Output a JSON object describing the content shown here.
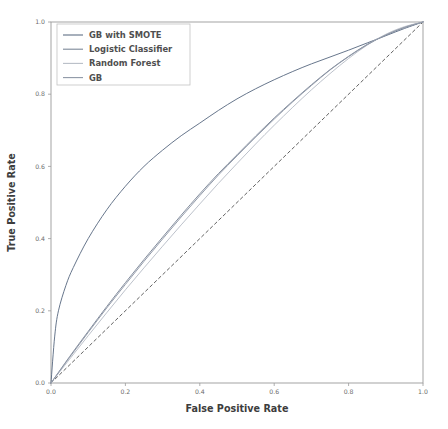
{
  "chart_data": {
    "type": "line",
    "title": "",
    "xlabel": "False Positive Rate",
    "ylabel": "True Positive Rate",
    "xlim": [
      0.0,
      1.0
    ],
    "ylim": [
      0.0,
      1.0
    ],
    "grid": false,
    "legend_position": "upper-left",
    "xticks": [
      "0.0",
      "0.2",
      "0.4",
      "0.6",
      "0.8",
      "1.0"
    ],
    "xtick_values": [
      0.0,
      0.2,
      0.4,
      0.6,
      0.8,
      1.0
    ],
    "yticks": [
      "0.0",
      "0.2",
      "0.4",
      "0.6",
      "0.8",
      "1.0"
    ],
    "ytick_values": [
      0.0,
      0.2,
      0.4,
      0.6,
      0.8,
      1.0
    ],
    "series": [
      {
        "name": "GB with SMOTE",
        "color": "#5f6f86",
        "dash": "none",
        "x": [
          0.0,
          0.01,
          0.02,
          0.04,
          0.06,
          0.1,
          0.15,
          0.2,
          0.25,
          0.3,
          0.35,
          0.4,
          0.45,
          0.5,
          0.55,
          0.6,
          0.65,
          0.7,
          0.75,
          0.8,
          0.85,
          0.9,
          0.95,
          1.0
        ],
        "values": [
          0.0,
          0.13,
          0.2,
          0.27,
          0.32,
          0.4,
          0.48,
          0.545,
          0.6,
          0.645,
          0.685,
          0.72,
          0.755,
          0.787,
          0.815,
          0.84,
          0.863,
          0.884,
          0.903,
          0.922,
          0.942,
          0.962,
          0.982,
          1.0
        ]
      },
      {
        "name": "Logistic Classifier",
        "color": "#7d8899",
        "dash": "none",
        "x": [
          0.0,
          0.05,
          0.1,
          0.15,
          0.2,
          0.25,
          0.3,
          0.35,
          0.4,
          0.45,
          0.5,
          0.55,
          0.6,
          0.65,
          0.7,
          0.75,
          0.8,
          0.85,
          0.9,
          0.95,
          1.0
        ],
        "values": [
          0.0,
          0.073,
          0.143,
          0.212,
          0.278,
          0.342,
          0.404,
          0.465,
          0.524,
          0.58,
          0.632,
          0.684,
          0.734,
          0.781,
          0.826,
          0.868,
          0.905,
          0.938,
          0.964,
          0.985,
          1.0
        ]
      },
      {
        "name": "Random Forest",
        "color": "#b8bec7",
        "dash": "none",
        "x": [
          0.0,
          0.05,
          0.1,
          0.15,
          0.2,
          0.25,
          0.3,
          0.35,
          0.4,
          0.45,
          0.5,
          0.55,
          0.6,
          0.65,
          0.7,
          0.75,
          0.8,
          0.85,
          0.9,
          0.95,
          1.0
        ],
        "values": [
          0.0,
          0.066,
          0.131,
          0.195,
          0.258,
          0.319,
          0.379,
          0.438,
          0.496,
          0.553,
          0.608,
          0.662,
          0.714,
          0.764,
          0.812,
          0.857,
          0.899,
          0.936,
          0.966,
          0.987,
          1.0
        ]
      },
      {
        "name": "GB",
        "color": "#8e97a6",
        "dash": "none",
        "x": [
          0.0,
          0.05,
          0.1,
          0.15,
          0.2,
          0.25,
          0.3,
          0.35,
          0.4,
          0.45,
          0.5,
          0.55,
          0.6,
          0.65,
          0.7,
          0.75,
          0.8,
          0.85,
          0.9,
          0.95,
          1.0
        ],
        "values": [
          0.0,
          0.071,
          0.14,
          0.208,
          0.273,
          0.337,
          0.399,
          0.46,
          0.519,
          0.576,
          0.629,
          0.681,
          0.731,
          0.779,
          0.824,
          0.867,
          0.904,
          0.937,
          0.964,
          0.985,
          1.0
        ]
      },
      {
        "name": "chance-reference",
        "color": "#5a5a5a",
        "dash": "3,3",
        "x": [
          0.0,
          1.0
        ],
        "values": [
          0.0,
          1.0
        ]
      }
    ],
    "legend_entries": [
      {
        "label": "GB with SMOTE",
        "color": "#5f6f86"
      },
      {
        "label": "Logistic Classifier",
        "color": "#7d8899"
      },
      {
        "label": "Random Forest",
        "color": "#b8bec7"
      },
      {
        "label": "GB",
        "color": "#8e97a6"
      }
    ]
  }
}
